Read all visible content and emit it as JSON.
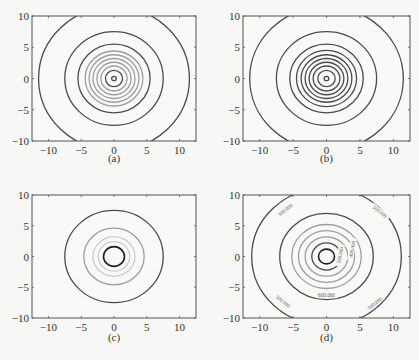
{
  "figure": {
    "panels": [
      {
        "id": "a",
        "caption": "(a)"
      },
      {
        "id": "b",
        "caption": "(b)"
      },
      {
        "id": "c",
        "caption": "(c)"
      },
      {
        "id": "d",
        "caption": "(d)"
      }
    ]
  },
  "chart_data": [
    {
      "type": "contour",
      "panel": "(a)",
      "title": "",
      "xlabel": "",
      "ylabel": "",
      "xlim": [
        -12.5,
        12.5
      ],
      "ylim": [
        -10,
        10
      ],
      "xticks": [
        -10,
        -5,
        0,
        5,
        10
      ],
      "yticks": [
        -10,
        -5,
        0,
        5,
        10
      ],
      "grid": false,
      "center": [
        0,
        0
      ],
      "contours": [
        {
          "radius": 0.35,
          "shade": "dark"
        },
        {
          "radius": 1.3,
          "shade": "dark"
        },
        {
          "radius": 2.0,
          "shade": "light"
        },
        {
          "radius": 2.6,
          "shade": "light"
        },
        {
          "radius": 3.2,
          "shade": "light"
        },
        {
          "radius": 3.8,
          "shade": "light"
        },
        {
          "radius": 4.4,
          "shade": "light"
        },
        {
          "radius": 5.5,
          "shade": "dark"
        },
        {
          "radius": 7.5,
          "shade": "dark"
        },
        {
          "radius": 11.5,
          "shade": "dark"
        }
      ]
    },
    {
      "type": "contour",
      "panel": "(b)",
      "title": "",
      "xlabel": "",
      "ylabel": "",
      "xlim": [
        -12.5,
        12.5
      ],
      "ylim": [
        -10,
        10
      ],
      "xticks": [
        -10,
        -5,
        0,
        5,
        10
      ],
      "yticks": [
        -10,
        -5,
        0,
        5,
        10
      ],
      "grid": false,
      "center": [
        0,
        0
      ],
      "contours": [
        {
          "radius": 0.35,
          "shade": "dark"
        },
        {
          "radius": 1.3,
          "shade": "dark"
        },
        {
          "radius": 2.0,
          "shade": "dark"
        },
        {
          "radius": 2.6,
          "shade": "dark"
        },
        {
          "radius": 3.2,
          "shade": "dark"
        },
        {
          "radius": 3.8,
          "shade": "dark"
        },
        {
          "radius": 4.5,
          "shade": "dark"
        },
        {
          "radius": 5.5,
          "shade": "dark"
        },
        {
          "radius": 7.5,
          "shade": "dark"
        },
        {
          "radius": 11.5,
          "shade": "dark"
        }
      ]
    },
    {
      "type": "contour",
      "panel": "(c)",
      "title": "",
      "xlabel": "",
      "ylabel": "",
      "xlim": [
        -12.5,
        12.5
      ],
      "ylim": [
        -10,
        10
      ],
      "xticks": [
        -10,
        -5,
        0,
        5,
        10
      ],
      "yticks": [
        -10,
        -5,
        0,
        5,
        10
      ],
      "grid": false,
      "center": [
        0,
        0
      ],
      "contours": [
        {
          "radius": 1.6,
          "shade": "black"
        },
        {
          "radius": 2.4,
          "shade": "faint"
        },
        {
          "radius": 3.2,
          "shade": "faint"
        },
        {
          "radius": 4.6,
          "shade": "light"
        },
        {
          "radius": 7.5,
          "shade": "dark"
        }
      ]
    },
    {
      "type": "contour",
      "panel": "(d)",
      "title": "",
      "xlabel": "",
      "ylabel": "",
      "xlim": [
        -12.5,
        12.5
      ],
      "ylim": [
        -10,
        10
      ],
      "xticks": [
        -10,
        -5,
        0,
        5,
        10
      ],
      "yticks": [
        -10,
        -5,
        0,
        5,
        10
      ],
      "grid": false,
      "center": [
        0,
        0
      ],
      "contours": [
        {
          "radius": 1.2,
          "shade": "black"
        },
        {
          "radius": 2.2,
          "shade": "dark",
          "label": "300.000"
        },
        {
          "radius": 3.2,
          "shade": "light",
          "label": "400.000"
        },
        {
          "radius": 4.2,
          "shade": "light"
        },
        {
          "radius": 5.2,
          "shade": "light"
        },
        {
          "radius": 7.0,
          "shade": "dark",
          "label": "600.000"
        },
        {
          "radius": 11.2,
          "shade": "dark",
          "label": "500.000"
        }
      ],
      "annotations": [
        "500.000",
        "300.000",
        "600.000",
        "400.000"
      ]
    }
  ]
}
